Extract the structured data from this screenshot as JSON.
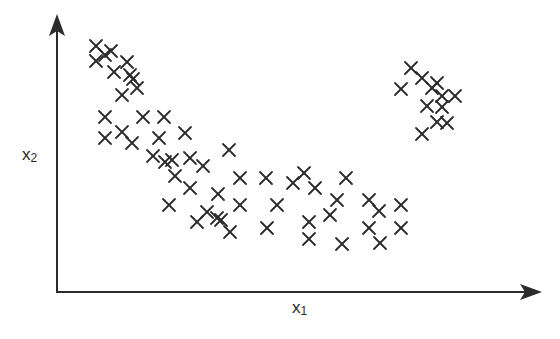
{
  "chart_data": {
    "type": "scatter",
    "title": "",
    "xlabel": "x",
    "xlabel_sub": "1",
    "ylabel": "x",
    "ylabel_sub": "2",
    "grid": false,
    "legend": null,
    "marker": "x",
    "color": "#2b2b2b",
    "axis_color": "#2b2b2b",
    "axes": {
      "origin_px": [
        57,
        292
      ],
      "x_end_px": 540,
      "y_end_px": 16,
      "arrow_heads": true,
      "ticks": false
    },
    "note": "Unlabeled axes; points given as pixel coordinates (x right, y down) within 560x339 canvas. Three visual clusters: a diagonal band from upper-left descending to a lower-middle group, and a separate compact cluster at upper-right.",
    "points": [
      {
        "x": 96,
        "y": 46
      },
      {
        "x": 111,
        "y": 51
      },
      {
        "x": 127,
        "y": 62
      },
      {
        "x": 96,
        "y": 61
      },
      {
        "x": 105,
        "y": 55
      },
      {
        "x": 114,
        "y": 72
      },
      {
        "x": 130,
        "y": 75
      },
      {
        "x": 133,
        "y": 79
      },
      {
        "x": 122,
        "y": 95
      },
      {
        "x": 137,
        "y": 88
      },
      {
        "x": 105,
        "y": 117
      },
      {
        "x": 143,
        "y": 117
      },
      {
        "x": 164,
        "y": 117
      },
      {
        "x": 105,
        "y": 138
      },
      {
        "x": 122,
        "y": 132
      },
      {
        "x": 132,
        "y": 143
      },
      {
        "x": 159,
        "y": 138
      },
      {
        "x": 185,
        "y": 133
      },
      {
        "x": 153,
        "y": 156
      },
      {
        "x": 165,
        "y": 162
      },
      {
        "x": 172,
        "y": 160
      },
      {
        "x": 175,
        "y": 176
      },
      {
        "x": 190,
        "y": 158
      },
      {
        "x": 203,
        "y": 166
      },
      {
        "x": 229,
        "y": 150
      },
      {
        "x": 169,
        "y": 205
      },
      {
        "x": 190,
        "y": 188
      },
      {
        "x": 218,
        "y": 194
      },
      {
        "x": 240,
        "y": 178
      },
      {
        "x": 240,
        "y": 205
      },
      {
        "x": 207,
        "y": 212
      },
      {
        "x": 197,
        "y": 222
      },
      {
        "x": 217,
        "y": 218
      },
      {
        "x": 221,
        "y": 220
      },
      {
        "x": 230,
        "y": 232
      },
      {
        "x": 266,
        "y": 178
      },
      {
        "x": 267,
        "y": 228
      },
      {
        "x": 277,
        "y": 205
      },
      {
        "x": 293,
        "y": 183
      },
      {
        "x": 304,
        "y": 173
      },
      {
        "x": 315,
        "y": 188
      },
      {
        "x": 309,
        "y": 222
      },
      {
        "x": 309,
        "y": 239
      },
      {
        "x": 330,
        "y": 215
      },
      {
        "x": 337,
        "y": 200
      },
      {
        "x": 346,
        "y": 178
      },
      {
        "x": 342,
        "y": 244
      },
      {
        "x": 369,
        "y": 200
      },
      {
        "x": 379,
        "y": 211
      },
      {
        "x": 369,
        "y": 228
      },
      {
        "x": 380,
        "y": 243
      },
      {
        "x": 401,
        "y": 205
      },
      {
        "x": 401,
        "y": 228
      },
      {
        "x": 411,
        "y": 68
      },
      {
        "x": 422,
        "y": 78
      },
      {
        "x": 401,
        "y": 89
      },
      {
        "x": 437,
        "y": 83
      },
      {
        "x": 432,
        "y": 88
      },
      {
        "x": 442,
        "y": 96
      },
      {
        "x": 427,
        "y": 106
      },
      {
        "x": 442,
        "y": 107
      },
      {
        "x": 455,
        "y": 96
      },
      {
        "x": 437,
        "y": 122
      },
      {
        "x": 447,
        "y": 123
      },
      {
        "x": 422,
        "y": 134
      }
    ]
  },
  "labels": {
    "x_main": "x",
    "x_sub": "1",
    "y_main": "x",
    "y_sub": "2"
  }
}
